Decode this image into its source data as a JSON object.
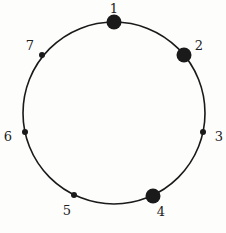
{
  "diagram": {
    "type": "circle-with-points",
    "center": [
      114,
      113
    ],
    "radius": 91,
    "stroke_color": "#1a1a1a",
    "points": [
      {
        "label": "1",
        "x": 114,
        "y": 22,
        "size": "large",
        "lx": 114,
        "ly": 13
      },
      {
        "label": "2",
        "x": 184,
        "y": 55,
        "size": "large",
        "lx": 199,
        "ly": 50
      },
      {
        "label": "3",
        "x": 203,
        "y": 132,
        "size": "small",
        "lx": 219,
        "ly": 141
      },
      {
        "label": "4",
        "x": 153,
        "y": 196,
        "size": "large",
        "lx": 161,
        "ly": 216
      },
      {
        "label": "5",
        "x": 74,
        "y": 195,
        "size": "small",
        "lx": 67,
        "ly": 215
      },
      {
        "label": "6",
        "x": 25,
        "y": 132,
        "size": "small",
        "lx": 8,
        "ly": 141
      },
      {
        "label": "7",
        "x": 42,
        "y": 55,
        "size": "small",
        "lx": 30,
        "ly": 50
      }
    ]
  }
}
